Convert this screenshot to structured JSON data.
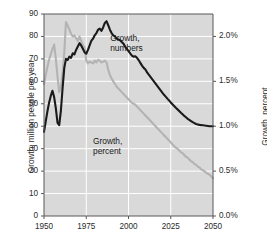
{
  "chart_data": {
    "type": "line",
    "title": "",
    "xlabel": "",
    "ylabel": "Growth, million people per year",
    "y2label": "Growth, percent",
    "xlim": [
      1950,
      2050
    ],
    "ylim": [
      0,
      90
    ],
    "y2lim": [
      0.0,
      2.25
    ],
    "grid": true,
    "legend_position": "inline-annotations",
    "xticks": [
      "1950",
      "1975",
      "2000",
      "2025",
      "2050"
    ],
    "xtick_values": [
      1950,
      1975,
      2000,
      2025,
      2050
    ],
    "yticks": [
      "0",
      "10",
      "20",
      "30",
      "40",
      "50",
      "60",
      "70",
      "80",
      "90"
    ],
    "ytick_values": [
      0,
      10,
      20,
      30,
      40,
      50,
      60,
      70,
      80,
      90
    ],
    "y2ticks": [
      "0.0%",
      "0.5%",
      "1.0%",
      "1.5%",
      "2.0%"
    ],
    "y2tick_values": [
      0.0,
      0.5,
      1.0,
      1.5,
      2.0
    ],
    "annotations": [
      {
        "name": "growth-numbers-label",
        "line1": "Growth,",
        "line2": "numbers",
        "x": 2001,
        "y": 79
      },
      {
        "name": "growth-percent-label",
        "line1": "Growth,",
        "line2": "percent",
        "x": 1992,
        "y": 33
      }
    ],
    "series": [
      {
        "name": "Growth, numbers",
        "axis": "left",
        "color": "#1a1a1a",
        "unit": "million people per year",
        "x": [
          1950,
          1951,
          1952,
          1953,
          1954,
          1955,
          1956,
          1957,
          1958,
          1959,
          1960,
          1961,
          1962,
          1963,
          1964,
          1965,
          1966,
          1967,
          1968,
          1969,
          1970,
          1971,
          1972,
          1973,
          1974,
          1975,
          1976,
          1977,
          1978,
          1979,
          1980,
          1981,
          1982,
          1983,
          1984,
          1985,
          1986,
          1987,
          1988,
          1989,
          1990,
          1991,
          1992,
          1993,
          1994,
          1995,
          1996,
          1997,
          1998,
          1999,
          2000,
          2001,
          2002,
          2003,
          2004,
          2005,
          2006,
          2007,
          2008,
          2009,
          2010,
          2011,
          2012,
          2013,
          2014,
          2015,
          2016,
          2017,
          2018,
          2019,
          2020,
          2021,
          2022,
          2023,
          2024,
          2025,
          2026,
          2027,
          2028,
          2029,
          2030,
          2031,
          2032,
          2033,
          2034,
          2035,
          2036,
          2037,
          2038,
          2039,
          2040,
          2041,
          2042,
          2043,
          2044,
          2045,
          2046,
          2047,
          2048,
          2049,
          2050
        ],
        "values": [
          37.5,
          42.0,
          46.5,
          50.5,
          53.5,
          55.8,
          53.0,
          48.0,
          41.5,
          40.5,
          47.0,
          57.0,
          66.0,
          70.0,
          69.5,
          71.0,
          70.5,
          72.5,
          72.0,
          74.0,
          75.5,
          77.0,
          76.0,
          74.5,
          73.0,
          72.3,
          74.0,
          76.0,
          78.0,
          79.0,
          80.5,
          81.5,
          83.0,
          83.5,
          82.5,
          84.0,
          86.0,
          86.8,
          85.0,
          83.0,
          81.5,
          80.5,
          80.0,
          79.0,
          78.6,
          78.3,
          77.5,
          76.8,
          75.5,
          74.5,
          73.5,
          72.5,
          71.5,
          71.0,
          71.2,
          70.5,
          69.5,
          68.2,
          67.0,
          66.0,
          65.3,
          64.0,
          63.0,
          62.0,
          61.0,
          60.0,
          59.0,
          58.0,
          57.0,
          56.0,
          55.0,
          54.0,
          53.2,
          52.3,
          51.5,
          50.6,
          49.8,
          49.0,
          48.2,
          47.5,
          46.8,
          46.0,
          45.3,
          44.6,
          44.0,
          43.3,
          42.8,
          42.3,
          41.8,
          41.4,
          41.0,
          40.8,
          40.6,
          40.5,
          40.4,
          40.3,
          40.2,
          40.1,
          40.0,
          40.0,
          40.0
        ]
      },
      {
        "name": "Growth, percent",
        "axis": "right",
        "color": "#b3b3b3",
        "unit": "percent",
        "x": [
          1950,
          1951,
          1952,
          1953,
          1954,
          1955,
          1956,
          1957,
          1958,
          1959,
          1960,
          1961,
          1962,
          1963,
          1964,
          1965,
          1966,
          1967,
          1968,
          1969,
          1970,
          1971,
          1972,
          1973,
          1974,
          1975,
          1976,
          1977,
          1978,
          1979,
          1980,
          1981,
          1982,
          1983,
          1984,
          1985,
          1986,
          1987,
          1988,
          1989,
          1990,
          1991,
          1992,
          1993,
          1994,
          1995,
          1996,
          1997,
          1998,
          1999,
          2000,
          2001,
          2002,
          2003,
          2004,
          2005,
          2006,
          2007,
          2008,
          2009,
          2010,
          2011,
          2012,
          2013,
          2014,
          2015,
          2016,
          2017,
          2018,
          2019,
          2020,
          2021,
          2022,
          2023,
          2024,
          2025,
          2026,
          2027,
          2028,
          2029,
          2030,
          2031,
          2032,
          2033,
          2034,
          2035,
          2036,
          2037,
          2038,
          2039,
          2040,
          2041,
          2042,
          2043,
          2044,
          2045,
          2046,
          2047,
          2048,
          2049,
          2050
        ],
        "values": [
          1.47,
          1.57,
          1.66,
          1.74,
          1.8,
          1.86,
          1.91,
          1.75,
          1.55,
          1.38,
          1.44,
          1.6,
          1.82,
          2.16,
          2.12,
          2.08,
          2.03,
          2.0,
          2.01,
          1.98,
          1.95,
          2.0,
          1.95,
          1.9,
          1.88,
          1.73,
          1.7,
          1.72,
          1.71,
          1.7,
          1.73,
          1.71,
          1.74,
          1.73,
          1.71,
          1.72,
          1.73,
          1.71,
          1.63,
          1.57,
          1.53,
          1.5,
          1.47,
          1.44,
          1.42,
          1.4,
          1.38,
          1.36,
          1.34,
          1.32,
          1.3,
          1.28,
          1.26,
          1.25,
          1.24,
          1.22,
          1.2,
          1.18,
          1.16,
          1.14,
          1.12,
          1.1,
          1.08,
          1.06,
          1.04,
          1.02,
          1.0,
          0.98,
          0.96,
          0.94,
          0.92,
          0.9,
          0.88,
          0.86,
          0.84,
          0.82,
          0.8,
          0.78,
          0.76,
          0.75,
          0.73,
          0.71,
          0.7,
          0.68,
          0.66,
          0.65,
          0.63,
          0.61,
          0.6,
          0.58,
          0.57,
          0.55,
          0.54,
          0.52,
          0.51,
          0.5,
          0.48,
          0.47,
          0.46,
          0.44,
          0.42
        ]
      }
    ]
  },
  "colors": {
    "plot_background": "#d9d9d9",
    "gridline": "#ffffff",
    "axis": "#595959",
    "series_numbers": "#1a1a1a",
    "series_percent": "#b3b3b3",
    "text": "#2b2b2b"
  }
}
